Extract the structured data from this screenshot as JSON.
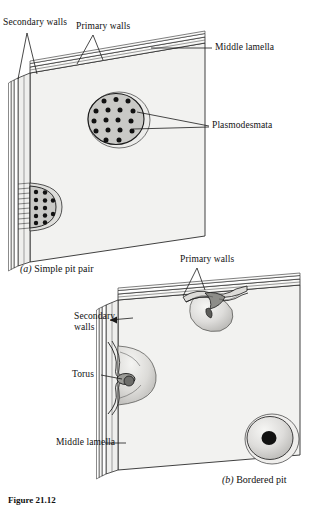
{
  "figure": {
    "number": "Figure 21.12",
    "panels": [
      {
        "id": "a",
        "marker": "(a)",
        "caption": "Simple pit pair"
      },
      {
        "id": "b",
        "marker": "(b)",
        "caption": "Bordered pit"
      }
    ]
  },
  "panel_a": {
    "labels": {
      "secondary_walls": "Secondary walls",
      "primary_walls": "Primary walls",
      "middle_lamella": "Middle lamella",
      "plasmodesmata": "Plasmodesmata"
    },
    "pit_face": {
      "dot_rows": [
        3,
        4,
        4,
        4,
        2
      ],
      "dot_count": 17
    },
    "pit_edge": {
      "dot_rows": [
        3,
        3,
        3,
        3
      ],
      "dot_count": 12
    }
  },
  "panel_b": {
    "labels": {
      "primary_walls": "Primary walls",
      "secondary_walls": "Secondary walls",
      "torus": "Torus",
      "middle_lamella": "Middle lamella"
    },
    "pits": [
      {
        "name": "top-edge-bordered-pit",
        "view": "cutaway"
      },
      {
        "name": "left-edge-bordered-pit",
        "view": "cutaway-torus"
      },
      {
        "name": "face-bordered-pit",
        "view": "face-aperture"
      }
    ]
  },
  "colors": {
    "ink": "#1a1a1a",
    "wall_face": "#f1f1ef",
    "wall_shadow": "#e2e1de",
    "pit_fill": "#c9c9c6",
    "dot": "#111111",
    "paper": "#ffffff"
  }
}
